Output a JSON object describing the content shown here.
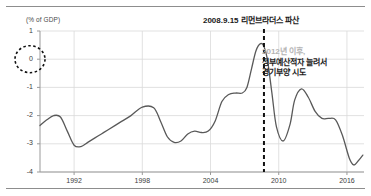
{
  "chart_data": {
    "type": "line",
    "title": "2008.9.15 리먼브라더스 파산",
    "xlabel": "",
    "ylabel": "(% of GDP)",
    "ylim": [
      -4,
      1
    ],
    "xlim": [
      1989,
      2017.5
    ],
    "grid": true,
    "legend": "none",
    "yticks": [
      "1",
      "0",
      "-1",
      "-2",
      "-3",
      "-4"
    ],
    "ytick_values": [
      1,
      0,
      -1,
      -2,
      -3,
      -4
    ],
    "xticks": [
      "1992",
      "1998",
      "2004",
      "2010",
      "2016"
    ],
    "xtick_values": [
      1992,
      1998,
      2004,
      2010,
      2016
    ],
    "series": [
      {
        "name": "정부예산수지 (% of GDP)",
        "color": "#595959",
        "x": [
          1989.0,
          1989.6,
          1990.2,
          1990.8,
          1991.4,
          1992.0,
          1992.6,
          1993.2,
          1993.8,
          1994.4,
          1995.0,
          1996.0,
          1997.0,
          1998.0,
          1999.0,
          1999.6,
          2000.2,
          2000.8,
          2001.4,
          2002.0,
          2002.6,
          2003.2,
          2003.8,
          2004.4,
          2005.0,
          2005.6,
          2006.2,
          2006.8,
          2007.2,
          2007.6,
          2008.0,
          2008.4,
          2008.7,
          2009.0,
          2009.4,
          2009.8,
          2010.4,
          2011.0,
          2011.4,
          2012.0,
          2012.6,
          2013.2,
          2013.8,
          2014.4,
          2015.0,
          2015.6,
          2016.2,
          2016.6,
          2017.0,
          2017.4
        ],
        "y": [
          -2.35,
          -2.15,
          -2.0,
          -2.05,
          -2.55,
          -3.05,
          -3.1,
          -2.95,
          -2.8,
          -2.65,
          -2.5,
          -2.25,
          -2.0,
          -1.7,
          -1.72,
          -2.2,
          -2.75,
          -2.95,
          -2.9,
          -2.65,
          -2.55,
          -2.6,
          -2.55,
          -2.2,
          -1.5,
          -1.25,
          -1.2,
          -1.2,
          -1.0,
          -0.35,
          0.3,
          0.55,
          0.45,
          0.0,
          -1.2,
          -2.4,
          -2.9,
          -2.3,
          -1.45,
          -1.05,
          -1.35,
          -1.85,
          -2.1,
          -2.1,
          -2.15,
          -2.7,
          -3.5,
          -3.75,
          -3.6,
          -3.4
        ]
      }
    ],
    "annotations": [
      {
        "name": "lehman-event-marker",
        "type": "vertical-dashed-line",
        "x": 2008.7,
        "color": "#111111",
        "label": "2008.9.15 리먼브라더스 파산"
      },
      {
        "name": "zero-highlight",
        "type": "dashed-circle",
        "target": "y-tick 0",
        "color": "#111111"
      },
      {
        "name": "stimulus-note",
        "type": "text-block",
        "lines": [
          {
            "text": "2012년 이후,",
            "color": "#b4b4b4"
          },
          {
            "text": "정부예산적자 늘려서",
            "color": "#1c1c1c"
          },
          {
            "text": "경기부양 시도",
            "color": "#1c1c1c"
          }
        ]
      }
    ]
  },
  "axis": {
    "unit_label": "(% of GDP)",
    "y_labels": [
      "1",
      "0",
      "-1",
      "-2",
      "-3",
      "-4"
    ],
    "x_labels": [
      "1992",
      "1998",
      "2004",
      "2010",
      "2016"
    ]
  },
  "event": {
    "title": "2008.9.15 리먼브라더스 파산"
  },
  "note": {
    "line1": "2012년 이후,",
    "line2": "정부예산적자 늘려서",
    "line3": "경기부양 시도"
  },
  "colors": {
    "line": "#595959",
    "grid": "#d9d9d9",
    "axis": "#9a9a9a",
    "marker": "#111111",
    "muted_text": "#b4b4b4"
  }
}
